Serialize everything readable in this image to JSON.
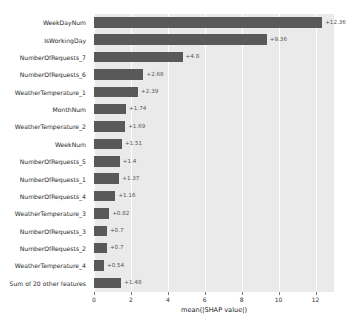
{
  "chart_data": {
    "type": "bar",
    "orientation": "horizontal",
    "title": "",
    "xlabel": "mean(|SHAP value|)",
    "ylabel": "",
    "xlim": [
      0,
      13.0
    ],
    "xticks": [
      0,
      2,
      4,
      6,
      8,
      10,
      12
    ],
    "xticklabels": [
      "0",
      "2",
      "4",
      "6",
      "8",
      "10",
      "12"
    ],
    "grid": true,
    "grid_axis": "x",
    "legend": "none",
    "plot_background": "#eaeaea",
    "bar_color": "#595959",
    "categories": [
      "WeekDayNum",
      "IsWorkingDay",
      "NumberOfRequests_7",
      "NumberOfRequests_6",
      "WeatherTemperature_1",
      "MonthNum",
      "WeatherTemperature_2",
      "WeekNum",
      "NumberOfRequests_5",
      "NumberOfRequests_1",
      "NumberOfRequests_4",
      "WeatherTemperature_3",
      "NumberOfRequests_3",
      "NumberOfRequests_2",
      "WeatherTemperature_4",
      "Sum of 20 other features"
    ],
    "values": [
      12.36,
      9.36,
      4.8,
      2.68,
      2.39,
      1.74,
      1.69,
      1.51,
      1.4,
      1.37,
      1.16,
      0.82,
      0.7,
      0.7,
      0.54,
      1.48
    ],
    "value_labels": [
      "+12.36",
      "+9.36",
      "+4.8",
      "+2.68",
      "+2.39",
      "+1.74",
      "+1.69",
      "+1.51",
      "+1.4",
      "+1.37",
      "+1.16",
      "+0.82",
      "+0.7",
      "+0.7",
      "+0.54",
      "+1.48"
    ]
  }
}
